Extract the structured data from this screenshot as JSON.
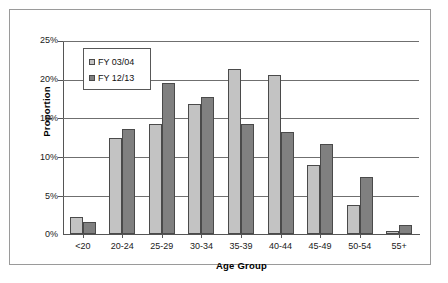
{
  "chart_data": {
    "type": "bar",
    "title": "",
    "xlabel": "Age Group",
    "ylabel": "Proportion",
    "ylim": [
      0,
      25
    ],
    "ytick_labels": [
      "25%",
      "20%",
      "15%",
      "10%",
      "5%",
      "0%"
    ],
    "ytick_values": [
      25,
      20,
      15,
      10,
      5,
      0
    ],
    "grid": true,
    "legend_position": "upper-left-inside",
    "categories": [
      "<20",
      "20-24",
      "25-29",
      "30-34",
      "35-39",
      "40-44",
      "45-49",
      "50-54",
      "55+"
    ],
    "series": [
      {
        "name": "FY 03/04",
        "color": "#C3C3C3",
        "values": [
          2.2,
          12.5,
          14.2,
          16.8,
          21.4,
          20.6,
          8.9,
          3.7,
          0.4
        ]
      },
      {
        "name": "FY 12/13",
        "color": "#808080",
        "values": [
          1.6,
          13.6,
          19.5,
          17.8,
          14.2,
          13.2,
          11.7,
          7.4,
          1.2
        ]
      }
    ]
  }
}
